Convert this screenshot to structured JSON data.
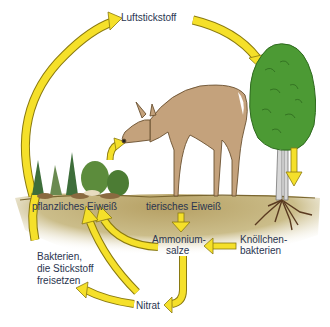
{
  "diagram": {
    "colors": {
      "arrow_fill": "#f5e02a",
      "arrow_stroke": "#8a7a10",
      "soil": "#b8a56a",
      "soil_light": "#e6dcb8",
      "tree_green": "#4c9a34",
      "deer": "#c4a27c",
      "text": "#2a3550"
    },
    "labels": {
      "luftstickstoff": "Luftstickstoff",
      "pflanzliches_eiweiss": "pflanzliches Eiweiß",
      "tierisches_eiweiss": "tierisches Eiweiß",
      "ammonium_1": "Ammonium-",
      "ammonium_2": "salze",
      "knoellchen_1": "Knöllchen-",
      "knoellchen_2": "bakterien",
      "bakterien_1": "Bakterien,",
      "bakterien_2": "die Stickstoff",
      "bakterien_3": "freisetzen",
      "nitrat": "Nitrat"
    },
    "illustrations": [
      "plants",
      "deer",
      "tree-with-roots",
      "soil-layer"
    ],
    "flows": [
      {
        "from": "Bakterien, die Stickstoff freisetzen",
        "to": "Luftstickstoff"
      },
      {
        "from": "Luftstickstoff",
        "to": "Baum (Knöllchenbakterien)"
      },
      {
        "from": "Baum",
        "to": "Wurzeln/Knöllchenbakterien"
      },
      {
        "from": "Knöllchenbakterien",
        "to": "Ammoniumsalze"
      },
      {
        "from": "pflanzliches Eiweiß",
        "to": "Reh"
      },
      {
        "from": "tierisches Eiweiß",
        "to": "Ammoniumsalze"
      },
      {
        "from": "Ammoniumsalze",
        "to": "pflanzliches Eiweiß"
      },
      {
        "from": "Ammoniumsalze",
        "to": "Nitrat"
      },
      {
        "from": "Nitrat",
        "to": "pflanzliches Eiweiß"
      },
      {
        "from": "Nitrat",
        "to": "Bakterien, die Stickstoff freisetzen"
      }
    ]
  }
}
